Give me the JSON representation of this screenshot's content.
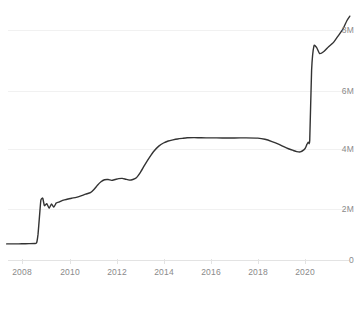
{
  "chart_data": {
    "type": "line",
    "title": "",
    "subtitle": "",
    "xlabel": "",
    "ylabel": "",
    "legend": [],
    "legend_position": "none",
    "grid": true,
    "xlim": [
      2007.3,
      2022.0
    ],
    "ylim": [
      0,
      8800000
    ],
    "y_ticks": [
      0,
      2000000,
      4000000,
      6000000,
      8000000
    ],
    "y_tick_labels": [
      "0",
      "2M",
      "4M",
      "6M",
      "8M"
    ],
    "y_axis_side": "right",
    "x_ticks": [
      2008,
      2010,
      2012,
      2014,
      2016,
      2018,
      2020
    ],
    "x_tick_labels": [
      "2008",
      "2010",
      "2012",
      "2014",
      "2016",
      "2018",
      "2020"
    ],
    "line_color": "#333333",
    "grid_color": "#f1f1f1",
    "axis_color": "#e3e3e3",
    "tick_text_color": "#8a8a8a",
    "series": [
      {
        "name": "value",
        "x": [
          2007.35,
          2007.7,
          2008.0,
          2008.3,
          2008.55,
          2008.62,
          2008.68,
          2008.74,
          2008.8,
          2008.88,
          2008.95,
          2009.05,
          2009.15,
          2009.25,
          2009.35,
          2009.45,
          2009.55,
          2009.68,
          2009.8,
          2009.95,
          2010.1,
          2010.3,
          2010.5,
          2010.7,
          2010.9,
          2011.05,
          2011.2,
          2011.35,
          2011.5,
          2011.65,
          2011.8,
          2011.95,
          2012.1,
          2012.25,
          2012.4,
          2012.55,
          2012.7,
          2012.85,
          2013.0,
          2013.2,
          2013.4,
          2013.6,
          2013.8,
          2014.0,
          2014.2,
          2014.4,
          2014.6,
          2014.8,
          2015.0,
          2015.3,
          2015.6,
          2016.0,
          2016.5,
          2017.0,
          2017.5,
          2018.0,
          2018.3,
          2018.6,
          2018.9,
          2019.1,
          2019.3,
          2019.5,
          2019.65,
          2019.8,
          2019.95,
          2020.02,
          2020.08,
          2020.14,
          2020.2,
          2020.28,
          2020.38,
          2020.5,
          2020.62,
          2020.8,
          2021.0,
          2021.2,
          2021.4,
          2021.6,
          2021.78,
          2021.9
        ],
        "values": [
          560000,
          560000,
          565000,
          570000,
          575000,
          600000,
          900000,
          1500000,
          2080000,
          2150000,
          1890000,
          1960000,
          1800000,
          1950000,
          1840000,
          1980000,
          2010000,
          2060000,
          2090000,
          2120000,
          2150000,
          2180000,
          2230000,
          2290000,
          2340000,
          2450000,
          2600000,
          2720000,
          2790000,
          2800000,
          2770000,
          2800000,
          2830000,
          2840000,
          2810000,
          2780000,
          2800000,
          2860000,
          3020000,
          3300000,
          3560000,
          3790000,
          3960000,
          4070000,
          4140000,
          4180000,
          4210000,
          4230000,
          4250000,
          4255000,
          4250000,
          4248000,
          4245000,
          4245000,
          4248000,
          4240000,
          4200000,
          4120000,
          4020000,
          3940000,
          3870000,
          3810000,
          3770000,
          3760000,
          3830000,
          3900000,
          4020000,
          4100000,
          4150000,
          6600000,
          7450000,
          7380000,
          7180000,
          7250000,
          7420000,
          7560000,
          7790000,
          8020000,
          8330000,
          8480000
        ]
      }
    ]
  },
  "axis": {
    "y_labels": [
      "8M",
      "6M",
      "4M",
      "2M",
      "0"
    ],
    "x_labels": [
      "2008",
      "2010",
      "2012",
      "2014",
      "2016",
      "2018",
      "2020"
    ]
  }
}
